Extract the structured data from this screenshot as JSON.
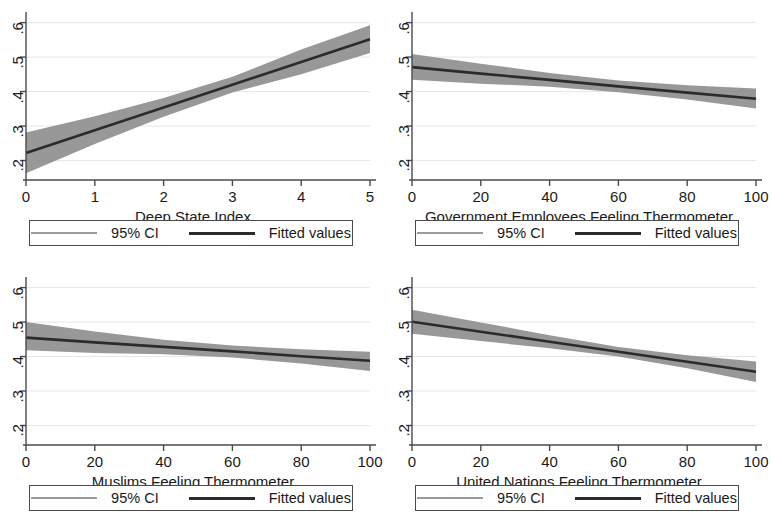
{
  "figure": {
    "panel_count": 4,
    "legend": {
      "ci_label": "95% CI",
      "fitted_label": "Fitted values"
    },
    "colors": {
      "ci_band": "#8a8a8a",
      "ci_legend_line": "#9b9b9b",
      "fitted_line": "#2b2b2b",
      "axis": "#4a4a4a",
      "grid": "#e6e6e6",
      "background": "#ffffff"
    }
  },
  "chart_data": [
    {
      "id": "panel-deep-state-index",
      "type": "line",
      "title": "",
      "xlabel": "Deep State Index",
      "ylabel": "",
      "xlim": [
        0,
        5
      ],
      "ylim": [
        0.155,
        0.625
      ],
      "xticks": [
        "0",
        "1",
        "2",
        "3",
        "4",
        "5"
      ],
      "xtick_values": [
        0,
        1,
        2,
        3,
        4,
        5
      ],
      "yticks": [
        ".2",
        ".3",
        ".4",
        ".5",
        ".6"
      ],
      "ytick_values": [
        0.2,
        0.3,
        0.4,
        0.5,
        0.6
      ],
      "grid": true,
      "legend_position": "below",
      "series": [
        {
          "name": "Fitted values",
          "x": [
            0,
            1,
            2,
            3,
            4,
            5
          ],
          "values": [
            0.222,
            0.288,
            0.354,
            0.42,
            0.486,
            0.552
          ]
        },
        {
          "name": "95% CI upper",
          "x": [
            0,
            1,
            2,
            3,
            4,
            5
          ],
          "values": [
            0.281,
            0.328,
            0.381,
            0.443,
            0.522,
            0.592
          ]
        },
        {
          "name": "95% CI lower",
          "x": [
            0,
            1,
            2,
            3,
            4,
            5
          ],
          "values": [
            0.163,
            0.248,
            0.327,
            0.397,
            0.45,
            0.512
          ]
        }
      ]
    },
    {
      "id": "panel-government-employees",
      "type": "line",
      "title": "",
      "xlabel": "Government Employees Feeling Thermometer",
      "ylabel": "",
      "xlim": [
        0,
        100
      ],
      "ylim": [
        0.155,
        0.625
      ],
      "xticks": [
        "0",
        "20",
        "40",
        "60",
        "80",
        "100"
      ],
      "xtick_values": [
        0,
        20,
        40,
        60,
        80,
        100
      ],
      "yticks": [
        ".2",
        ".3",
        ".4",
        ".5",
        ".6"
      ],
      "ytick_values": [
        0.2,
        0.3,
        0.4,
        0.5,
        0.6
      ],
      "grid": true,
      "legend_position": "below",
      "series": [
        {
          "name": "Fitted values",
          "x": [
            0,
            20,
            40,
            60,
            80,
            100
          ],
          "values": [
            0.471,
            0.452,
            0.434,
            0.415,
            0.397,
            0.379
          ]
        },
        {
          "name": "95% CI upper",
          "x": [
            0,
            20,
            40,
            60,
            80,
            100
          ],
          "values": [
            0.509,
            0.481,
            0.454,
            0.432,
            0.418,
            0.409
          ]
        },
        {
          "name": "95% CI lower",
          "x": [
            0,
            20,
            40,
            60,
            80,
            100
          ],
          "values": [
            0.434,
            0.423,
            0.414,
            0.398,
            0.377,
            0.351
          ]
        }
      ]
    },
    {
      "id": "panel-muslims",
      "type": "line",
      "title": "",
      "xlabel": "Muslims Feeling Thermometer",
      "ylabel": "",
      "xlim": [
        0,
        100
      ],
      "ylim": [
        0.155,
        0.625
      ],
      "xticks": [
        "0",
        "20",
        "40",
        "60",
        "80",
        "100"
      ],
      "xtick_values": [
        0,
        20,
        40,
        60,
        80,
        100
      ],
      "yticks": [
        ".2",
        ".3",
        ".4",
        ".5",
        ".6"
      ],
      "ytick_values": [
        0.2,
        0.3,
        0.4,
        0.5,
        0.6
      ],
      "grid": true,
      "legend_position": "below",
      "series": [
        {
          "name": "Fitted values",
          "x": [
            0,
            20,
            40,
            60,
            80,
            100
          ],
          "values": [
            0.455,
            0.441,
            0.428,
            0.415,
            0.401,
            0.388
          ]
        },
        {
          "name": "95% CI upper",
          "x": [
            0,
            20,
            40,
            60,
            80,
            100
          ],
          "values": [
            0.5,
            0.473,
            0.449,
            0.432,
            0.421,
            0.414
          ]
        },
        {
          "name": "95% CI lower",
          "x": [
            0,
            20,
            40,
            60,
            80,
            100
          ],
          "values": [
            0.418,
            0.41,
            0.407,
            0.397,
            0.38,
            0.358
          ]
        }
      ]
    },
    {
      "id": "panel-united-nations",
      "type": "line",
      "title": "",
      "xlabel": "United Nations Feeling Thermometer",
      "ylabel": "",
      "xlim": [
        0,
        100
      ],
      "ylim": [
        0.155,
        0.625
      ],
      "xticks": [
        "0",
        "20",
        "40",
        "60",
        "80",
        "100"
      ],
      "xtick_values": [
        0,
        20,
        40,
        60,
        80,
        100
      ],
      "yticks": [
        ".2",
        ".3",
        ".4",
        ".5",
        ".6"
      ],
      "ytick_values": [
        0.2,
        0.3,
        0.4,
        0.5,
        0.6
      ],
      "grid": true,
      "legend_position": "below",
      "series": [
        {
          "name": "Fitted values",
          "x": [
            0,
            20,
            40,
            60,
            80,
            100
          ],
          "values": [
            0.501,
            0.472,
            0.443,
            0.414,
            0.385,
            0.356
          ]
        },
        {
          "name": "95% CI upper",
          "x": [
            0,
            20,
            40,
            60,
            80,
            100
          ],
          "values": [
            0.536,
            0.499,
            0.462,
            0.428,
            0.404,
            0.386
          ]
        },
        {
          "name": "95% CI lower",
          "x": [
            0,
            20,
            40,
            60,
            80,
            100
          ],
          "values": [
            0.466,
            0.445,
            0.424,
            0.4,
            0.366,
            0.326
          ]
        }
      ]
    }
  ]
}
